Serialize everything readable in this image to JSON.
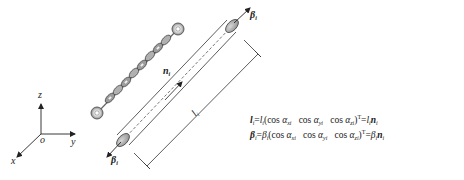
{
  "diagram": {
    "axes": {
      "origin_label": "o",
      "x_label": "x",
      "y_label": "y",
      "z_label": "z"
    },
    "chain_label": "n",
    "chain_label_sub": "i",
    "beta_top_label": "β",
    "beta_top_sub": "i",
    "beta_bottom_label": "β",
    "beta_bottom_sub": "i",
    "length_label": "l",
    "length_label_sub": "i",
    "colors": {
      "line": "#333333",
      "chain_fill": "#9a9a9a",
      "chain_dark": "#555555",
      "cap_fill": "#a8a8a8",
      "background": "#ffffff"
    }
  },
  "equations": {
    "eq1": {
      "lhs": "l",
      "lhs_sub": "i",
      "eq": "=",
      "scalar": "l",
      "scalar_sub": "i",
      "open": "(cos ",
      "alpha1": "α",
      "alpha1_sub": "xi",
      "cos2": "cos ",
      "alpha2": "α",
      "alpha2_sub": "yi",
      "cos3": "cos ",
      "alpha3": "α",
      "alpha3_sub": "zi",
      "close": ")",
      "transpose": "T",
      "eq2": "=",
      "rhs_scalar": "l",
      "rhs_scalar_sub": "i",
      "rhs_vec": "n",
      "rhs_vec_sub": "i"
    },
    "eq2": {
      "lhs": "β",
      "lhs_sub": "i",
      "eq": "=",
      "scalar": "β",
      "scalar_sub": "i",
      "open": "(cos ",
      "alpha1": "α",
      "alpha1_sub": "xi",
      "cos2": "cos ",
      "alpha2": "α",
      "alpha2_sub": "yi",
      "cos3": "cos ",
      "alpha3": "α",
      "alpha3_sub": "zi",
      "close": ")",
      "transpose": "T",
      "eq2": "=",
      "rhs_scalar": "β",
      "rhs_scalar_sub": "i",
      "rhs_vec": "n",
      "rhs_vec_sub": "i"
    },
    "brace": "}",
    "implies": "⇒",
    "result": {
      "frac1_num": "l",
      "frac1_num_sub": "i",
      "frac1_den": "l",
      "frac1_den_sub": "i",
      "eq1": "=",
      "frac2_num": "β",
      "frac2_num_sub": "i",
      "frac2_den": "β",
      "frac2_den_sub": "i",
      "eq2": "=",
      "vec": "n",
      "vec_sub": "i"
    }
  }
}
